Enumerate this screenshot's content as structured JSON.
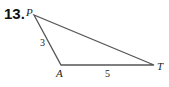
{
  "problem": {
    "number": "13."
  },
  "triangle": {
    "vertices": [
      {
        "name": "P",
        "x": 34,
        "y": 15
      },
      {
        "name": "A",
        "x": 61,
        "y": 65
      },
      {
        "name": "T",
        "x": 154,
        "y": 65
      }
    ],
    "sides": [
      {
        "from": "P",
        "to": "A",
        "length": "3"
      },
      {
        "from": "A",
        "to": "T",
        "length": "5"
      },
      {
        "from": "P",
        "to": "T",
        "length": ""
      }
    ]
  },
  "colors": {
    "line": "#555555",
    "text": "#222222"
  }
}
